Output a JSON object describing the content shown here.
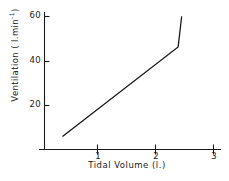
{
  "chart_data": {
    "type": "line",
    "title": "",
    "xlabel": "Tidal  Volume (l.)",
    "ylabel_prefix": "Ventilation ( l.min",
    "ylabel_exponent": "-1",
    "ylabel_suffix": ")",
    "ylabel_full": "Ventilation ( l.min-1)",
    "x": [
      0.4,
      2.37,
      2.43
    ],
    "y": [
      6,
      47,
      61
    ],
    "series": [
      {
        "name": "ventilation-response",
        "points": [
          {
            "x": 0.4,
            "y": 6
          },
          {
            "x": 2.37,
            "y": 47
          },
          {
            "x": 2.43,
            "y": 61
          }
        ]
      }
    ],
    "xlim": [
      0,
      3.1
    ],
    "ylim": [
      0,
      63
    ],
    "xticks": [
      1,
      2,
      3
    ],
    "xtick_labels": [
      "1",
      "2",
      "3"
    ],
    "yticks": [
      20,
      40,
      60
    ],
    "ytick_labels": [
      "20",
      "40",
      "60"
    ],
    "grid": false,
    "legend": "none",
    "line_color": "#151515",
    "axis_color": "#1a1a1a",
    "background": "#ffffff"
  },
  "axes": {
    "x_axis_name": "tidal-volume-axis",
    "y_axis_name": "ventilation-axis"
  }
}
